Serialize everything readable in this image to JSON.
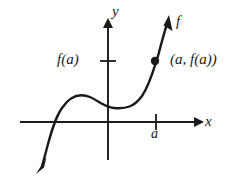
{
  "figure": {
    "kind": "cartesian-graph",
    "background_color": "#ffffff",
    "ink_color": "#1a1a1a"
  },
  "axes": {
    "x_axis_label": "x",
    "y_axis_label": "y",
    "origin": {
      "x": 108,
      "y": 122
    },
    "x_axis": {
      "start_x": 20,
      "end_x": 198,
      "y": 122,
      "arrow": "right"
    },
    "y_axis": {
      "x": 108,
      "start_y": 160,
      "end_y": 22,
      "arrow": "up"
    }
  },
  "ticks": [
    {
      "name": "x-tick-a",
      "label": "a",
      "axis": "x",
      "position": {
        "x": 156,
        "y": 122
      },
      "label_position": {
        "x": 151,
        "y": 127
      }
    },
    {
      "name": "y-tick-fa",
      "label": "f(a)",
      "axis": "y",
      "position": {
        "x": 108,
        "y": 61
      },
      "label_position": {
        "x": 57,
        "y": 52
      }
    }
  ],
  "curve": {
    "name": "function-curve",
    "label": "f",
    "label_position": {
      "x": 176,
      "y": 14
    },
    "shape": "cubic-with-inflection",
    "arrow_start": "down-left",
    "arrow_end": "up-right",
    "path": "M 42 166 C 47 150 52 122 62 108 C 70 96 80 93 90 97 C 99 101 104 107 114 108 C 126 109 134 107 142 96 C 150 84 154 68 158 56 C 161 45 164 33 167 24",
    "stroke_width": 2.4
  },
  "point": {
    "name": "point-a-fa",
    "label": "(a, f(a))",
    "coordinates": {
      "x": 155,
      "y": 61
    },
    "radius": 4,
    "filled": true
  },
  "caption_texts": {
    "y": "y",
    "x": "x",
    "f": "f",
    "a": "a",
    "fa": "f(a)",
    "point_label": "(a, f(a))"
  }
}
